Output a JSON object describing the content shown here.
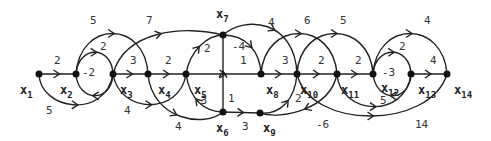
{
  "diagram": {
    "type": "signal-flow-graph",
    "nodes": [
      {
        "id": "x1",
        "name": "x",
        "sub": "1"
      },
      {
        "id": "x2",
        "name": "x",
        "sub": "2"
      },
      {
        "id": "x3",
        "name": "x",
        "sub": "3"
      },
      {
        "id": "x4",
        "name": "x",
        "sub": "4"
      },
      {
        "id": "x5",
        "name": "x",
        "sub": "5"
      },
      {
        "id": "x6",
        "name": "x",
        "sub": "6"
      },
      {
        "id": "x7",
        "name": "x",
        "sub": "7"
      },
      {
        "id": "x8",
        "name": "x",
        "sub": "8"
      },
      {
        "id": "x9",
        "name": "x",
        "sub": "9"
      },
      {
        "id": "x10",
        "name": "x",
        "sub": "10"
      },
      {
        "id": "x11",
        "name": "x",
        "sub": "11"
      },
      {
        "id": "x12",
        "name": "x",
        "sub": "12"
      },
      {
        "id": "x13",
        "name": "x",
        "sub": "13"
      },
      {
        "id": "x14",
        "name": "x",
        "sub": "14"
      }
    ],
    "edges": [
      {
        "from": "x1",
        "to": "x2",
        "gain": "2"
      },
      {
        "from": "x1",
        "to": "x3",
        "gain": "5"
      },
      {
        "from": "x2",
        "to": "x3",
        "gain": "2"
      },
      {
        "from": "x3",
        "to": "x2",
        "gain": "-2"
      },
      {
        "from": "x2",
        "to": "x4",
        "gain": "5"
      },
      {
        "from": "x3",
        "to": "x4",
        "gain": "3"
      },
      {
        "from": "x3",
        "to": "x7",
        "gain": "7"
      },
      {
        "from": "x3",
        "to": "x5",
        "gain": "4"
      },
      {
        "from": "x4",
        "to": "x5",
        "gain": "2"
      },
      {
        "from": "x4",
        "to": "x6",
        "gain": "4"
      },
      {
        "from": "x6",
        "to": "x5",
        "gain": "-3"
      },
      {
        "from": "x5",
        "to": "x7",
        "gain": "2"
      },
      {
        "from": "x5",
        "to": "x8",
        "gain": "1"
      },
      {
        "from": "x6",
        "to": "x7",
        "gain": "1"
      },
      {
        "from": "x7",
        "to": "x8",
        "gain": "-4"
      },
      {
        "from": "x7",
        "to": "x10",
        "gain": "4"
      },
      {
        "from": "x6",
        "to": "x9",
        "gain": "3"
      },
      {
        "from": "x8",
        "to": "x10",
        "gain": "3"
      },
      {
        "from": "x8",
        "to": "x11",
        "gain": "6"
      },
      {
        "from": "x9",
        "to": "x10",
        "gain": "2"
      },
      {
        "from": "x11",
        "to": "x9",
        "gain": "-6"
      },
      {
        "from": "x10",
        "to": "x11",
        "gain": "2"
      },
      {
        "from": "x10",
        "to": "x12",
        "gain": "5"
      },
      {
        "from": "x11",
        "to": "x12",
        "gain": "2"
      },
      {
        "from": "x11",
        "to": "x13",
        "gain": "5"
      },
      {
        "from": "x11",
        "to": "x14",
        "gain": "14"
      },
      {
        "from": "x12",
        "to": "x13",
        "gain": "2"
      },
      {
        "from": "x13",
        "to": "x12",
        "gain": "-3"
      },
      {
        "from": "x12",
        "to": "x14",
        "gain": "4"
      },
      {
        "from": "x13",
        "to": "x14",
        "gain": "4"
      }
    ]
  }
}
